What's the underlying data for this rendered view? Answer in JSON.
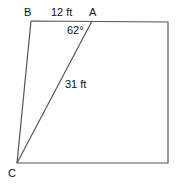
{
  "diagram": {
    "type": "geometry",
    "shape": "quadrilateral with diagonal",
    "points": {
      "B": {
        "label": "B",
        "x": 31,
        "y": 21
      },
      "A": {
        "label": "A",
        "x": 92,
        "y": 21
      },
      "TR": {
        "x": 168,
        "y": 22
      },
      "BR": {
        "x": 168,
        "y": 163
      },
      "C": {
        "label": "C",
        "x": 17,
        "y": 163
      }
    },
    "labels": {
      "point_b": "B",
      "point_a": "A",
      "point_c": "C",
      "side_ba": "12 ft",
      "side_ac": "31 ft",
      "angle_a": "62°"
    },
    "colors": {
      "line": "#555555",
      "text": "#111111",
      "background": "#ffffff"
    }
  }
}
